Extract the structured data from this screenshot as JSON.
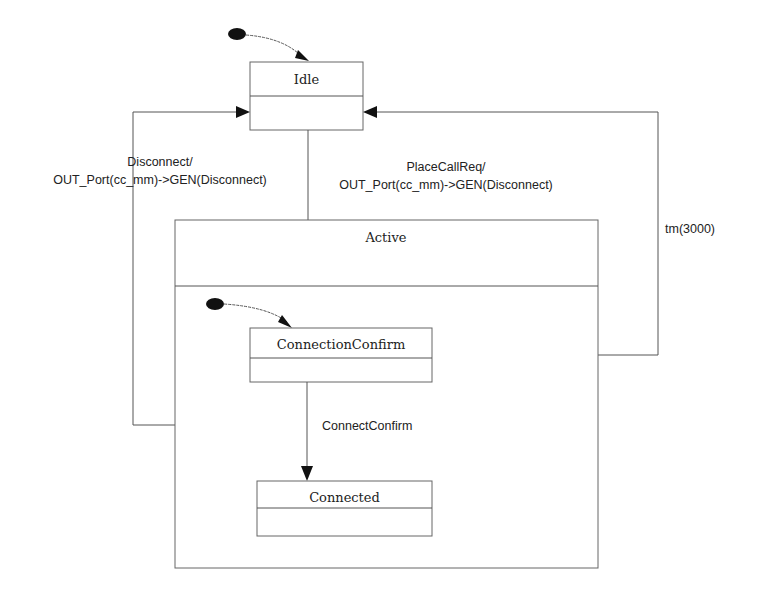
{
  "diagram": {
    "type": "state-machine",
    "states": [
      {
        "id": "idle",
        "name": "Idle"
      },
      {
        "id": "active",
        "name": "Active",
        "composite": true
      },
      {
        "id": "connection-confirm",
        "name": "ConnectionConfirm",
        "parent": "active"
      },
      {
        "id": "connected",
        "name": "Connected",
        "parent": "active"
      }
    ],
    "transitions": [
      {
        "id": "idle-to-active",
        "from": "idle",
        "to": "active",
        "label_line1": "PlaceCallReq/",
        "label_line2": "OUT_Port(cc_mm)->GEN(Disconnect)"
      },
      {
        "id": "active-to-idle",
        "from": "active",
        "to": "idle",
        "label_line1": "Disconnect/",
        "label_line2": "OUT_Port(cc_mm)->GEN(Disconnect)"
      },
      {
        "id": "cc-to-idle",
        "from": "connection-confirm",
        "to": "idle",
        "label_line1": "tm(3000)"
      },
      {
        "id": "cc-to-connected",
        "from": "connection-confirm",
        "to": "connected",
        "label_line1": "ConnectConfirm"
      }
    ],
    "initial_pseudostates": [
      {
        "target": "idle"
      },
      {
        "target": "connection-confirm"
      }
    ],
    "colors": {
      "line": "#555555",
      "fill": "#ffffff",
      "marker": "#111111",
      "text": "#222222"
    }
  }
}
